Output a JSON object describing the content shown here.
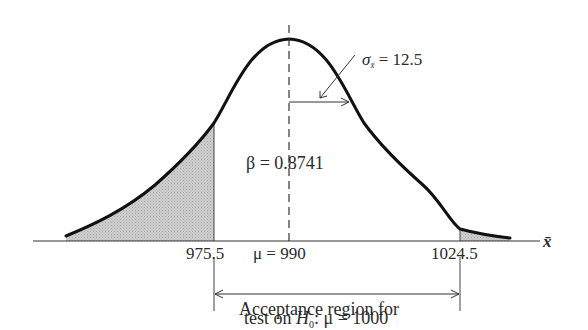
{
  "figure": {
    "type": "normal-distribution-diagram",
    "axis_label": "x̄",
    "mean_label": "μ = 990",
    "mean_value": 990,
    "sigma_label": "σ",
    "sigma_subscript": "x̄",
    "sigma_value_text": "= 12.5",
    "sigma_value": 12.5,
    "beta_label": "β = 0.8741",
    "beta_value": 0.8741,
    "left_critical": "975.5",
    "right_critical": "1024.5",
    "acceptance_line1": "Acceptance region for",
    "acceptance_line2_prefix": "test on ",
    "acceptance_h": "H",
    "acceptance_h_sub": "0",
    "acceptance_line2_suffix": ": μ = 1000",
    "colors": {
      "curve": "#111111",
      "shade": "#c8c8c8",
      "axis": "#333333"
    }
  }
}
